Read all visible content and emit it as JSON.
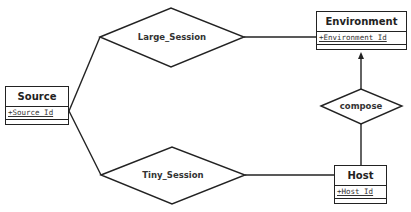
{
  "diagram": {
    "type": "er-diagram",
    "entities": [
      {
        "id": "source",
        "name": "Source",
        "attributes": [
          "+Source_Id"
        ]
      },
      {
        "id": "environment",
        "name": "Environment",
        "attributes": [
          "+Environment_Id"
        ]
      },
      {
        "id": "host",
        "name": "Host",
        "attributes": [
          "+Host_Id"
        ]
      }
    ],
    "relationships": [
      {
        "id": "large_session",
        "name": "Large_Session",
        "connects": [
          "Source",
          "Environment"
        ]
      },
      {
        "id": "tiny_session",
        "name": "Tiny_Session",
        "connects": [
          "Source",
          "Host"
        ]
      },
      {
        "id": "compose",
        "name": "compose",
        "connects": [
          "Host",
          "Environment"
        ],
        "arrow_to": "Environment"
      }
    ],
    "colors": {
      "stroke": "#222222",
      "background": "#ffffff",
      "text": "#222222"
    }
  }
}
